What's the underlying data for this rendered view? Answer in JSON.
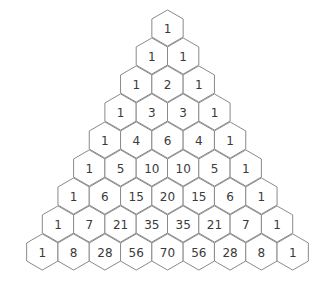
{
  "diagram": {
    "rows": [
      [
        1
      ],
      [
        1,
        1
      ],
      [
        1,
        2,
        1
      ],
      [
        1,
        3,
        3,
        1
      ],
      [
        1,
        4,
        6,
        4,
        1
      ],
      [
        1,
        5,
        10,
        10,
        5,
        1
      ],
      [
        1,
        6,
        15,
        20,
        15,
        6,
        1
      ],
      [
        1,
        7,
        21,
        35,
        35,
        21,
        7,
        1
      ],
      [
        1,
        8,
        28,
        56,
        70,
        56,
        28,
        8,
        1
      ]
    ],
    "colors": {
      "stroke": "#8a8a8a",
      "fill": "#ffffff",
      "text": "#3a3a3a"
    }
  }
}
